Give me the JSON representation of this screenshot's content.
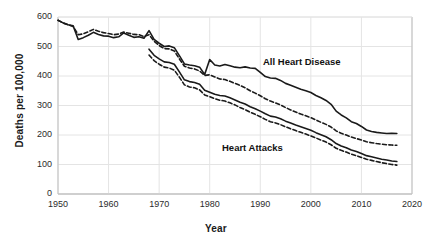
{
  "chart_data": {
    "type": "line",
    "title": "",
    "xlabel": "Year",
    "ylabel": "Deaths per 100,000",
    "xlim": [
      1950,
      2020
    ],
    "ylim": [
      0,
      600
    ],
    "grid": true,
    "legend_position": "inline-annotation",
    "xticks": [
      1950,
      1960,
      1970,
      1980,
      1990,
      2000,
      2010,
      2020
    ],
    "yticks": [
      0,
      100,
      200,
      300,
      400,
      500,
      600
    ],
    "annotations": [
      {
        "text": "All Heart Disease",
        "x": 1995,
        "y": 455
      },
      {
        "text": "Heart Attacks",
        "x": 1987,
        "y": 165
      }
    ],
    "series": [
      {
        "name": "All Heart Disease (solid)",
        "style": "solid",
        "color": "#1a1a1a",
        "x": [
          1950,
          1951,
          1952,
          1953,
          1954,
          1955,
          1956,
          1957,
          1958,
          1959,
          1960,
          1961,
          1962,
          1963,
          1964,
          1965,
          1966,
          1967,
          1968,
          1969,
          1970,
          1971,
          1972,
          1973,
          1974,
          1975,
          1976,
          1977,
          1978,
          1979,
          1980,
          1981,
          1982,
          1983,
          1984,
          1985,
          1986,
          1987,
          1988,
          1989,
          1990,
          1991,
          1992,
          1993,
          1994,
          1995,
          1996,
          1997,
          1998,
          1999,
          2000,
          2001,
          2002,
          2003,
          2004,
          2005,
          2006,
          2007,
          2008,
          2009,
          2010,
          2011,
          2012,
          2013,
          2014,
          2015,
          2016,
          2017
        ],
        "values": [
          589,
          580,
          574,
          570,
          524,
          530,
          538,
          548,
          541,
          536,
          535,
          530,
          533,
          546,
          538,
          531,
          533,
          528,
          554,
          524,
          511,
          500,
          502,
          496,
          469,
          441,
          437,
          435,
          430,
          405,
          456,
          437,
          434,
          439,
          435,
          430,
          428,
          431,
          427,
          426,
          412,
          398,
          393,
          392,
          385,
          375,
          369,
          362,
          355,
          350,
          344,
          334,
          326,
          317,
          304,
          281,
          268,
          258,
          245,
          239,
          229,
          217,
          212,
          209,
          207,
          205,
          206,
          205
        ]
      },
      {
        "name": "All Heart Disease (dashed)",
        "style": "dashed",
        "color": "#1a1a1a",
        "x": [
          1950,
          1951,
          1952,
          1953,
          1954,
          1955,
          1956,
          1957,
          1958,
          1959,
          1960,
          1961,
          1962,
          1963,
          1964,
          1965,
          1966,
          1967,
          1968,
          1969,
          1970,
          1971,
          1972,
          1973,
          1974,
          1975,
          1976,
          1977,
          1978,
          1979,
          1980,
          1981,
          1982,
          1983,
          1984,
          1985,
          1986,
          1987,
          1988,
          1989,
          1990,
          1991,
          1992,
          1993,
          1994,
          1995,
          1996,
          1997,
          1998,
          1999,
          2000,
          2001,
          2002,
          2003,
          2004,
          2005,
          2006,
          2007,
          2008,
          2009,
          2010,
          2011,
          2012,
          2013,
          2014,
          2015,
          2016,
          2017
        ],
        "values": [
          589,
          580,
          574,
          568,
          540,
          543,
          550,
          558,
          552,
          547,
          544,
          540,
          542,
          549,
          545,
          541,
          540,
          534,
          540,
          518,
          503,
          493,
          492,
          485,
          458,
          433,
          427,
          424,
          417,
          402,
          404,
          397,
          390,
          388,
          382,
          375,
          368,
          360,
          350,
          342,
          333,
          323,
          315,
          309,
          302,
          293,
          285,
          278,
          271,
          265,
          259,
          251,
          243,
          236,
          227,
          214,
          206,
          200,
          193,
          188,
          183,
          177,
          174,
          171,
          169,
          167,
          166,
          165
        ]
      },
      {
        "name": "Heart Attacks (solid)",
        "style": "solid",
        "color": "#1a1a1a",
        "x": [
          1968,
          1969,
          1970,
          1971,
          1972,
          1973,
          1974,
          1975,
          1976,
          1977,
          1978,
          1979,
          1980,
          1981,
          1982,
          1983,
          1984,
          1985,
          1986,
          1987,
          1988,
          1989,
          1990,
          1991,
          1992,
          1993,
          1994,
          1995,
          1996,
          1997,
          1998,
          1999,
          2000,
          2001,
          2002,
          2003,
          2004,
          2005,
          2006,
          2007,
          2008,
          2009,
          2010,
          2011,
          2012,
          2013,
          2014,
          2015,
          2016,
          2017
        ],
        "values": [
          491,
          470,
          458,
          448,
          446,
          440,
          414,
          387,
          381,
          378,
          372,
          352,
          345,
          338,
          334,
          332,
          326,
          319,
          311,
          305,
          296,
          289,
          281,
          272,
          264,
          261,
          255,
          247,
          241,
          234,
          228,
          222,
          216,
          208,
          201,
          194,
          184,
          171,
          163,
          157,
          149,
          144,
          137,
          130,
          126,
          122,
          118,
          115,
          112,
          110
        ]
      },
      {
        "name": "Heart Attacks (dashed)",
        "style": "dashed",
        "color": "#1a1a1a",
        "x": [
          1968,
          1969,
          1970,
          1971,
          1972,
          1973,
          1974,
          1975,
          1976,
          1977,
          1978,
          1979,
          1980,
          1981,
          1982,
          1983,
          1984,
          1985,
          1986,
          1987,
          1988,
          1989,
          1990,
          1991,
          1992,
          1993,
          1994,
          1995,
          1996,
          1997,
          1998,
          1999,
          2000,
          2001,
          2002,
          2003,
          2004,
          2005,
          2006,
          2007,
          2008,
          2009,
          2010,
          2011,
          2012,
          2013,
          2014,
          2015,
          2016,
          2017
        ],
        "values": [
          471,
          452,
          440,
          430,
          427,
          420,
          396,
          370,
          363,
          360,
          353,
          336,
          330,
          323,
          318,
          315,
          309,
          302,
          293,
          286,
          277,
          270,
          262,
          253,
          245,
          241,
          235,
          228,
          221,
          215,
          209,
          203,
          197,
          190,
          183,
          176,
          167,
          155,
          148,
          142,
          135,
          130,
          124,
          118,
          114,
          110,
          106,
          103,
          100,
          98
        ]
      }
    ]
  },
  "axes": {
    "ylabel": "Deaths per 100,000",
    "xlabel": "Year",
    "yticks": [
      "600",
      "500",
      "400",
      "300",
      "200",
      "100",
      "0"
    ],
    "xticks": [
      "1950",
      "1960",
      "1970",
      "1980",
      "1990",
      "2000",
      "2010",
      "2020"
    ]
  },
  "annotations": {
    "all_heart_disease": "All Heart Disease",
    "heart_attacks": "Heart Attacks"
  },
  "colors": {
    "line": "#1a1a1a",
    "grid": "#e4e4e4",
    "axis": "#bfbfbf",
    "text": "#2b2b2b",
    "background": "#ffffff"
  }
}
